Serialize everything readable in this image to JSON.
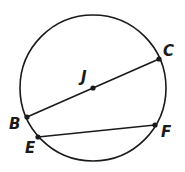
{
  "diagram": {
    "type": "circle-geometry",
    "circle": {
      "center_label": "J",
      "cx": 93,
      "cy": 88,
      "r": 73
    },
    "points": [
      {
        "id": "C",
        "label": "C",
        "x": 159,
        "y": 59,
        "lx": 163,
        "ly": 56
      },
      {
        "id": "J",
        "label": "J",
        "x": 93,
        "y": 88,
        "lx": 81,
        "ly": 82
      },
      {
        "id": "B",
        "label": "B",
        "x": 27,
        "y": 117,
        "lx": 9,
        "ly": 129
      },
      {
        "id": "E",
        "label": "E",
        "x": 38,
        "y": 137,
        "lx": 25,
        "ly": 153
      },
      {
        "id": "F",
        "label": "F",
        "x": 155,
        "y": 125,
        "lx": 161,
        "ly": 137
      }
    ],
    "segments": [
      {
        "name": "diameter-BC",
        "from": "B",
        "to": "C",
        "label": "BC"
      },
      {
        "name": "chord-EF",
        "from": "E",
        "to": "F",
        "label": "EF"
      }
    ],
    "colors": {
      "ink": "#1a1a1a",
      "background": "#ffffff"
    }
  }
}
